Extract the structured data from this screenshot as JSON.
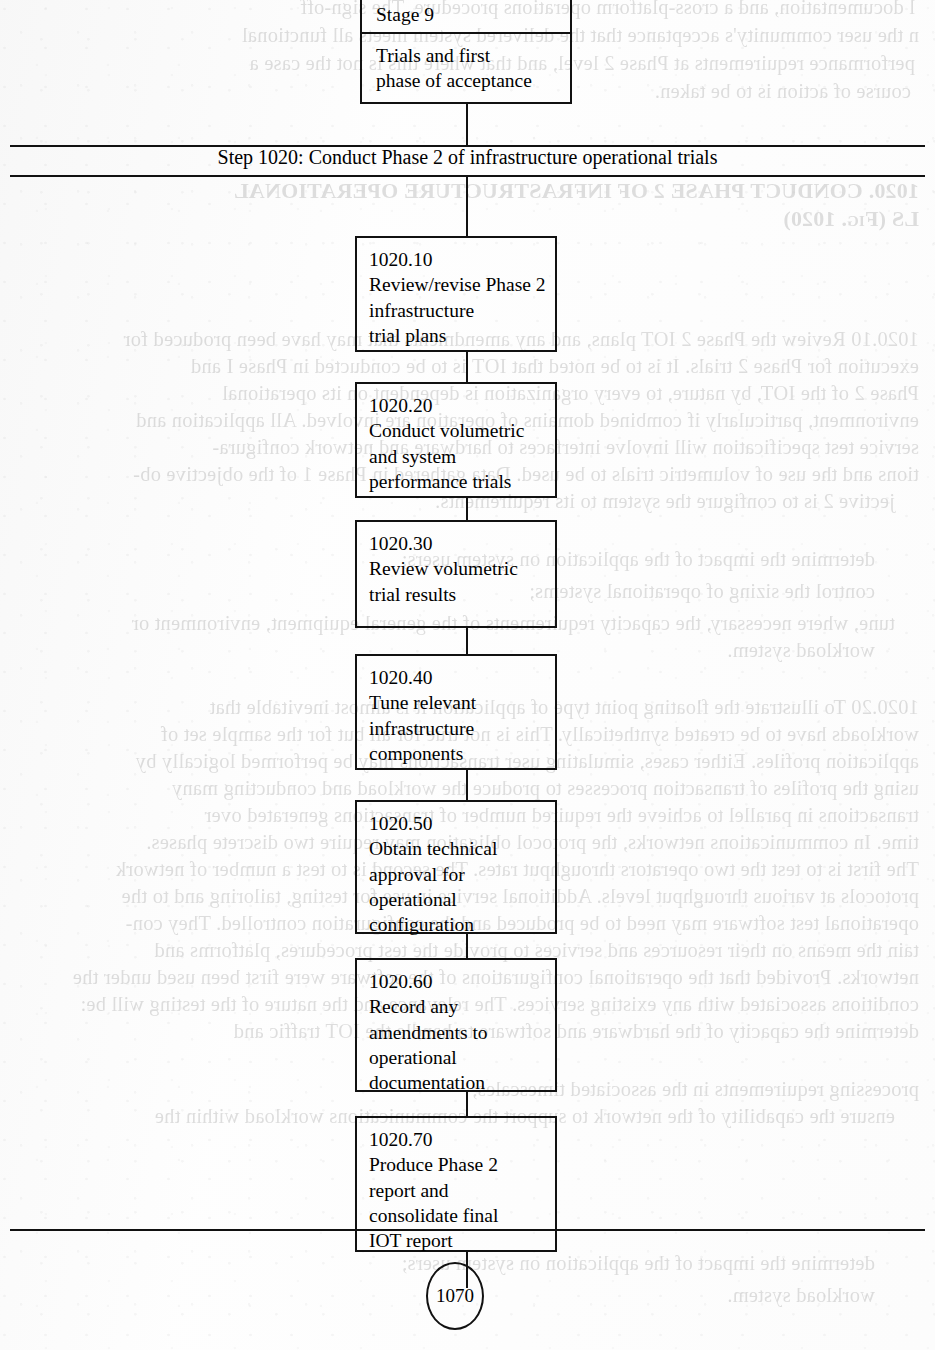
{
  "page": {
    "width": 935,
    "height": 1350,
    "ink_color": "#111111",
    "paper_color": "#fefefe"
  },
  "stage_header": {
    "stage_label": "Stage 9",
    "stage_description": "Trials and first\nphase of acceptance"
  },
  "step_banner": {
    "label": "Step 1020: Conduct Phase 2 of infrastructure operational trials"
  },
  "flow_nodes": [
    {
      "id": "1020.10",
      "text": "1020.10\nReview/revise Phase 2\ninfrastructure\ntrial plans"
    },
    {
      "id": "1020.20",
      "text": "1020.20\nConduct volumetric\nand system\nperformance trials"
    },
    {
      "id": "1020.30",
      "text": "1020.30\nReview volumetric\ntrial results"
    },
    {
      "id": "1020.40",
      "text": "1020.40\nTune relevant\ninfrastructure\ncomponents"
    },
    {
      "id": "1020.50",
      "text": "1020.50\nObtain technical\napproval for\noperational\nconfiguration"
    },
    {
      "id": "1020.60",
      "text": "1020.60\nRecord any\namendments to\noperational\ndocumentation"
    },
    {
      "id": "1020.70",
      "text": "1020.70\nProduce Phase 2\nreport and\nconsolidate final\nIOT report"
    }
  ],
  "terminator": {
    "label": "1070"
  },
  "show_through": {
    "note": "Mirrored ink bleed from the reverse side of the scanned sheet",
    "lines": [
      "l documentation, and a cross-platform operations procedure. The sign-off",
      "n the user community's acceptance that the delivered system meets all functional",
      "performance requirements at Phase 2 level, and that where this is not the case a",
      "course of action is to be taken.",
      "1020.  CONDUCT PHASE 2 OF INFRASTRUCTURE OPERATIONAL",
      "LS (Fig. 1020)",
      "1020.10  Review the Phase 2 IOT plans, and any amendments that may have been produced for",
      "execution for Phase 2 trials. It is to be noted that IOT is to be conducted in Phase I and",
      "Phase 2 of the IOT, by nature, to every organization is dependent on its operational",
      "environment, particularly if combined domains of operation are involved. All application and",
      "service test specification will involve interfaces to hardware and network configura-",
      "tions and the use of volumetric trials to be used. Data gathered in Phase 1 of the objective ob-",
      "jective 2 is to configure the system to its requirements.",
      "determine the impact of the application on system users;",
      "control the sizing of operational systems;",
      "tune, where necessary, the capacity requirements of the general equipment, environment or",
      "workload system.",
      "1020.20  To illustrate the floating point type of application it is almost inevitable that",
      "workloads have to be created synthetically. This is not true for all but for the sample set of",
      "application profiles. Either cases, simulating user transactions may be performed logically by",
      "using the profiles of transaction processes to produce the workload and conducting many",
      "transactions in parallel to achieve the required number of transactions generated over",
      "time. In communications networks, the protocol obligation may require two discrete phases.",
      "The first is to test the two operators throughput rates. The second is to test a number of network",
      "protocols at various throughput levels. Additional service in use for testing, tailoring and to the",
      "operational test software may need to be produced and the configuration controlled. They con-",
      "tain the means on their resources and services to provide the test procedures, platforms and",
      "networks. Provided that the operational configurations of the software were first been used under the",
      "conditions associated with any existing services. The relevance and the nature of the testing will be:",
      "determine the capacity of the hardware and software to handle the IOT traffic and",
      "processing requirements in the associated timescales;",
      "ensure the capability of the network to support the communications workload within the",
      "specified parameters."
    ]
  }
}
